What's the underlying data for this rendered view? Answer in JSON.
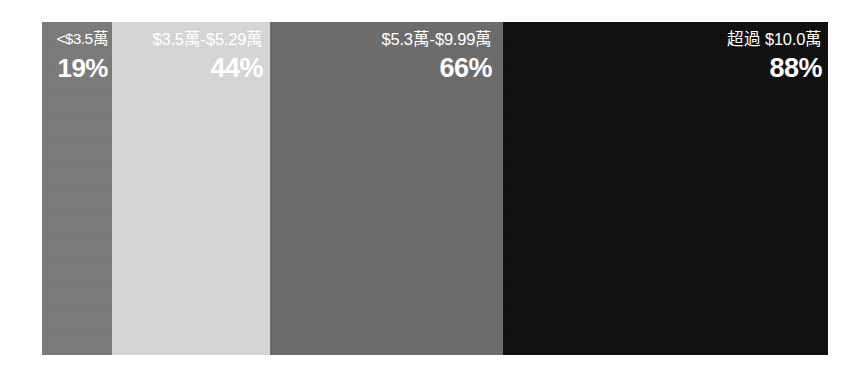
{
  "figure": {
    "type": "segmented-proportional-band",
    "background_color": "#ffffff",
    "text_color": "#ffffff"
  },
  "chart_data": {
    "type": "bar",
    "orientation": "horizontal-segmented",
    "title": "",
    "subtitle": "",
    "xlabel": "",
    "ylabel": "",
    "categories": [
      "<$3.5萬",
      "$3.5萬-$5.29萬",
      "$5.3萬-$9.99萬",
      "超過 $10.0萬"
    ],
    "values": [
      19,
      44,
      66,
      88
    ],
    "value_labels": [
      "19%",
      "44%",
      "66%",
      "88%"
    ],
    "ylim": [
      0,
      100
    ],
    "grid": false,
    "legend": "none",
    "segment_widths_px": [
      70,
      158,
      233,
      325
    ],
    "segment_colors": [
      "#7b7b7b",
      "#d9d9d9",
      "#6c6c6c",
      "#0d0d0d"
    ]
  },
  "panels": [
    {
      "label": "<$3.5萬",
      "value": "19%",
      "color": "#7b7b7b"
    },
    {
      "label": "$3.5萬-$5.29萬",
      "value": "44%",
      "color": "#d9d9d9"
    },
    {
      "label": "$5.3萬-$9.99萬",
      "value": "66%",
      "color": "#6c6c6c"
    },
    {
      "label": "超過 $10.0萬",
      "value": "88%",
      "color": "#0d0d0d"
    }
  ]
}
